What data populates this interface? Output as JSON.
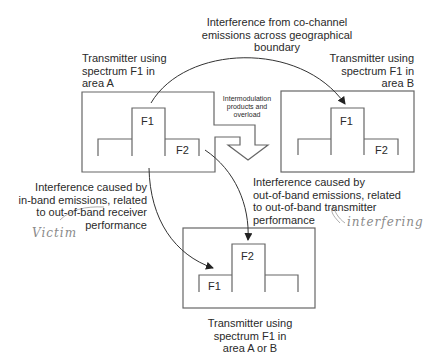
{
  "diagram": {
    "top_caption": "Interference from co-channel\nemissions across geographical\nboundary",
    "box_a": {
      "caption": "Transmitter using\nspectrum F1 in\narea A",
      "tall_label": "F1",
      "side_label": "F2"
    },
    "box_b": {
      "caption": "Transmitter using\nspectrum F1 in\narea B",
      "tall_label": "F1",
      "side_label": "F2"
    },
    "box_c": {
      "caption": "Transmitter using\nspectrum F1 in\narea A or B",
      "tall_label": "F2",
      "side_label": "F1"
    },
    "intermod_caption": "Intermodulation\nproducts and\noverload",
    "left_caption": "Interference caused by\nin-band emissions, related\nto out-of-band receiver\nperformance",
    "right_caption": "Interference caused by\nout-of-band emissions, related\nto out-of-band transmitter\nperformance",
    "handwritten_left": "Victim",
    "handwritten_right": "interfering",
    "colors": {
      "line": "#555555",
      "text": "#2a2a2a",
      "handwriting": "#8a8a8a"
    }
  }
}
